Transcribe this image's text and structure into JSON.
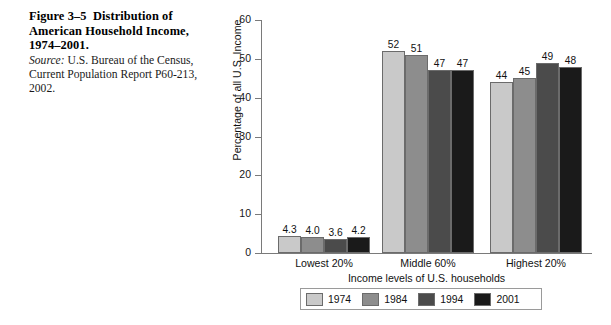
{
  "caption": {
    "figure_number": "Figure 3–5",
    "title_line1": "Distribution of",
    "title_line2": "American Household Income,",
    "title_line3": "1974–2001.",
    "source_label": "Source:",
    "source_text": " U.S. Bureau of the Census, Current Population Report P60-213, 2002."
  },
  "chart_data": {
    "type": "bar",
    "title": "",
    "xlabel": "Income levels of U.S. households",
    "ylabel": "Percentage of all U.S. Income",
    "categories": [
      "Lowest 20%",
      "Middle 60%",
      "Highest 20%"
    ],
    "yticks": [
      0,
      10,
      20,
      30,
      40,
      50,
      60
    ],
    "ylim": [
      0,
      60
    ],
    "grid": false,
    "legend_position": "bottom",
    "series": [
      {
        "name": "1974",
        "color": "#c9c9c9",
        "values": [
          4.3,
          52,
          44
        ],
        "labels": [
          "4.3",
          "52",
          "44"
        ]
      },
      {
        "name": "1984",
        "color": "#8d8d8d",
        "values": [
          4.0,
          51,
          45
        ],
        "labels": [
          "4.0",
          "51",
          "45"
        ]
      },
      {
        "name": "1994",
        "color": "#4b4b4b",
        "values": [
          3.6,
          47,
          49
        ],
        "labels": [
          "3.6",
          "47",
          "49"
        ]
      },
      {
        "name": "2001",
        "color": "#1a1a1a",
        "values": [
          4.2,
          47,
          48
        ],
        "labels": [
          "4.2",
          "47",
          "48"
        ]
      }
    ]
  }
}
